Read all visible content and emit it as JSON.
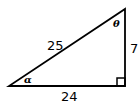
{
  "diagram": {
    "type": "right-triangle",
    "hypotenuse_label": "25",
    "vertical_leg_label": "7",
    "horizontal_leg_label": "24",
    "top_angle_label": "θ",
    "bottom_left_angle_label": "α",
    "right_angle_marker": "bottom-right",
    "line_color": "#000000",
    "background": "#ffffff"
  }
}
